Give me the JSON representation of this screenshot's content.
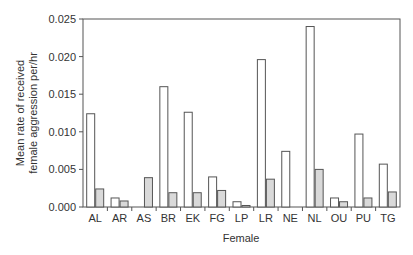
{
  "chart_data": {
    "type": "bar",
    "title": "",
    "xlabel": "Female",
    "ylabel": "Mean rate of received female aggression per/hr",
    "ylabel_lines": [
      "Mean rate of received",
      "female aggression per/hr"
    ],
    "ylim": [
      0,
      0.025
    ],
    "yticks": [
      "0.000",
      "0.005",
      "0.010",
      "0.015",
      "0.020",
      "0.025"
    ],
    "grid": false,
    "legend": null,
    "categories": [
      "AL",
      "AR",
      "AS",
      "BR",
      "EK",
      "FG",
      "LP",
      "LR",
      "NE",
      "NL",
      "OU",
      "PU",
      "TG"
    ],
    "series": [
      {
        "name": "series-1 (white)",
        "color": "#ffffff",
        "values": [
          0.0124,
          0.0012,
          0.0,
          0.016,
          0.0126,
          0.004,
          0.0007,
          0.0196,
          0.0074,
          0.024,
          0.0012,
          0.0097,
          0.0057
        ]
      },
      {
        "name": "series-2 (grey)",
        "color": "#d9d9d9",
        "values": [
          0.0024,
          0.0008,
          0.0039,
          0.0019,
          0.0019,
          0.0022,
          0.0002,
          0.0037,
          0.0,
          0.005,
          0.0007,
          0.0012,
          0.002
        ]
      }
    ]
  },
  "colors": {
    "axis": "#555555",
    "bar_stroke": "#555555",
    "text": "#333333"
  }
}
